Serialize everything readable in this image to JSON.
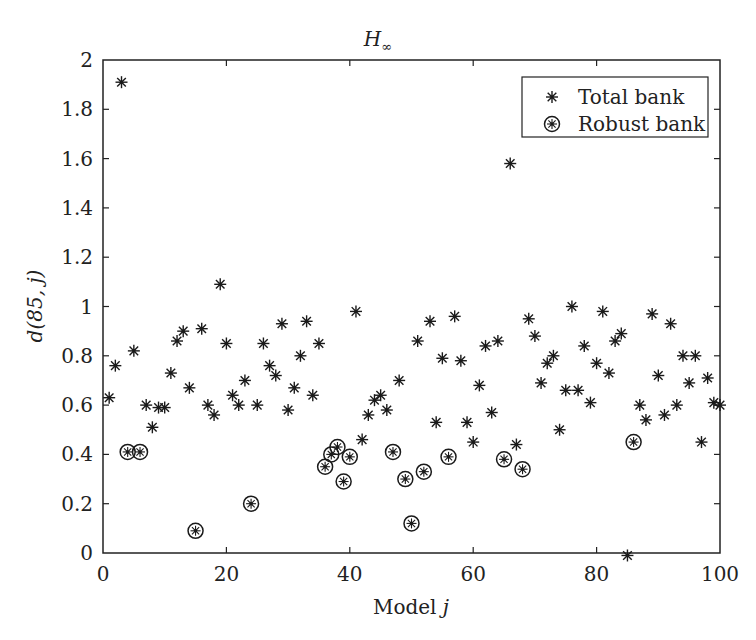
{
  "chart_data": {
    "type": "scatter",
    "title": "H∞",
    "title_main": "H",
    "title_sub": "∞",
    "xlabel": "Model j",
    "xlabel_main": "Model ",
    "xlabel_var": "j",
    "ylabel": "d(85, j)",
    "xlim": [
      0,
      100
    ],
    "ylim": [
      0,
      2
    ],
    "xticks": [
      0,
      20,
      40,
      60,
      80,
      100
    ],
    "yticks": [
      0,
      0.2,
      0.4,
      0.6,
      0.8,
      1,
      1.2,
      1.4,
      1.6,
      1.8,
      2
    ],
    "ytick_labels": [
      "0",
      "0.2",
      "0.4",
      "0.6",
      "0.8",
      "1",
      "1.2",
      "1.4",
      "1.6",
      "1.8",
      "2"
    ],
    "xtick_labels": [
      "0",
      "20",
      "40",
      "60",
      "80",
      "100"
    ],
    "grid": false,
    "legend_position": "upper right",
    "series": [
      {
        "name": "Total bank",
        "marker": "asterisk",
        "points": [
          [
            1,
            0.63
          ],
          [
            2,
            0.76
          ],
          [
            3,
            1.91
          ],
          [
            5,
            0.82
          ],
          [
            7,
            0.6
          ],
          [
            8,
            0.51
          ],
          [
            9,
            0.59
          ],
          [
            10,
            0.59
          ],
          [
            11,
            0.73
          ],
          [
            12,
            0.86
          ],
          [
            13,
            0.9
          ],
          [
            14,
            0.67
          ],
          [
            16,
            0.91
          ],
          [
            17,
            0.6
          ],
          [
            18,
            0.56
          ],
          [
            19,
            1.09
          ],
          [
            20,
            0.85
          ],
          [
            21,
            0.64
          ],
          [
            22,
            0.6
          ],
          [
            23,
            0.7
          ],
          [
            25,
            0.6
          ],
          [
            26,
            0.85
          ],
          [
            27,
            0.76
          ],
          [
            28,
            0.72
          ],
          [
            29,
            0.93
          ],
          [
            30,
            0.58
          ],
          [
            31,
            0.67
          ],
          [
            32,
            0.8
          ],
          [
            33,
            0.94
          ],
          [
            34,
            0.64
          ],
          [
            35,
            0.85
          ],
          [
            41,
            0.98
          ],
          [
            42,
            0.46
          ],
          [
            43,
            0.56
          ],
          [
            44,
            0.62
          ],
          [
            45,
            0.64
          ],
          [
            46,
            0.58
          ],
          [
            48,
            0.7
          ],
          [
            51,
            0.86
          ],
          [
            53,
            0.94
          ],
          [
            54,
            0.53
          ],
          [
            55,
            0.79
          ],
          [
            57,
            0.96
          ],
          [
            58,
            0.78
          ],
          [
            59,
            0.53
          ],
          [
            60,
            0.45
          ],
          [
            61,
            0.68
          ],
          [
            62,
            0.84
          ],
          [
            63,
            0.57
          ],
          [
            64,
            0.86
          ],
          [
            66,
            1.58
          ],
          [
            67,
            0.44
          ],
          [
            69,
            0.95
          ],
          [
            70,
            0.88
          ],
          [
            71,
            0.69
          ],
          [
            72,
            0.77
          ],
          [
            73,
            0.8
          ],
          [
            74,
            0.5
          ],
          [
            75,
            0.66
          ],
          [
            76,
            1.0
          ],
          [
            77,
            0.66
          ],
          [
            78,
            0.84
          ],
          [
            79,
            0.61
          ],
          [
            80,
            0.77
          ],
          [
            81,
            0.98
          ],
          [
            82,
            0.73
          ],
          [
            83,
            0.86
          ],
          [
            84,
            0.89
          ],
          [
            85,
            -0.01
          ],
          [
            87,
            0.6
          ],
          [
            88,
            0.54
          ],
          [
            89,
            0.97
          ],
          [
            90,
            0.72
          ],
          [
            91,
            0.56
          ],
          [
            92,
            0.93
          ],
          [
            93,
            0.6
          ],
          [
            94,
            0.8
          ],
          [
            95,
            0.69
          ],
          [
            96,
            0.8
          ],
          [
            97,
            0.45
          ],
          [
            98,
            0.71
          ],
          [
            99,
            0.61
          ],
          [
            100,
            0.6
          ]
        ]
      },
      {
        "name": "Robust bank",
        "marker": "circled-asterisk",
        "points": [
          [
            4,
            0.41
          ],
          [
            6,
            0.41
          ],
          [
            15,
            0.09
          ],
          [
            24,
            0.2
          ],
          [
            36,
            0.35
          ],
          [
            37,
            0.4
          ],
          [
            38,
            0.43
          ],
          [
            39,
            0.29
          ],
          [
            40,
            0.39
          ],
          [
            47,
            0.41
          ],
          [
            49,
            0.3
          ],
          [
            50,
            0.12
          ],
          [
            52,
            0.33
          ],
          [
            56,
            0.39
          ],
          [
            65,
            0.38
          ],
          [
            68,
            0.34
          ],
          [
            86,
            0.45
          ]
        ]
      }
    ]
  },
  "legend": {
    "items": [
      {
        "label": "Total bank",
        "marker": "asterisk"
      },
      {
        "label": "Robust bank",
        "marker": "circled-asterisk"
      }
    ]
  }
}
